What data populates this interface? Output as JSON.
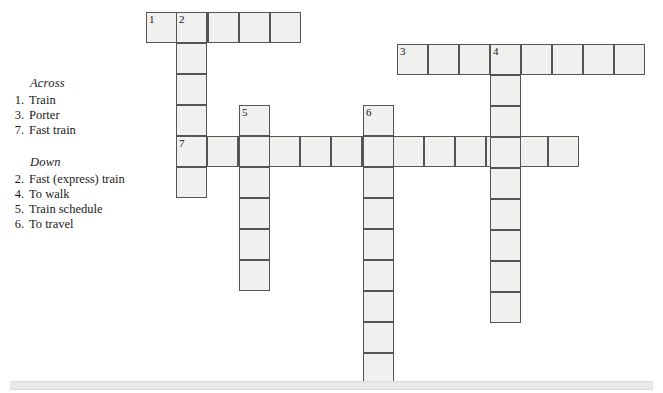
{
  "puzzle": {
    "title": "Crossword Puzzle",
    "cell_size": 31,
    "cell_fill": "#f0f0ee",
    "cell_border": "#555555"
  },
  "clues": {
    "across": {
      "heading": "Across",
      "items": [
        {
          "number": "1.",
          "text": "Train"
        },
        {
          "number": "3.",
          "text": "Porter"
        },
        {
          "number": "7.",
          "text": "Fast train"
        }
      ]
    },
    "down": {
      "heading": "Down",
      "items": [
        {
          "number": "2.",
          "text": "Fast (express) train"
        },
        {
          "number": "4.",
          "text": "To walk"
        },
        {
          "number": "5.",
          "text": "Train schedule"
        },
        {
          "number": "6.",
          "text": "To travel"
        }
      ]
    }
  },
  "grid": {
    "entries": [
      {
        "name": "across-1",
        "direction": "across",
        "number": "1",
        "x": 146,
        "y": 12,
        "length": 5
      },
      {
        "name": "across-3",
        "direction": "across",
        "number": "3",
        "x": 397,
        "y": 44,
        "length": 8
      },
      {
        "name": "across-7",
        "direction": "across",
        "number": "7",
        "x": 176,
        "y": 136,
        "length": 13
      },
      {
        "name": "down-2",
        "direction": "down",
        "number": "2",
        "x": 176,
        "y": 12,
        "length": 6
      },
      {
        "name": "down-4",
        "direction": "down",
        "number": "4",
        "x": 490,
        "y": 44,
        "length": 9
      },
      {
        "name": "down-5",
        "direction": "down",
        "number": "5",
        "x": 239,
        "y": 105,
        "length": 6
      },
      {
        "name": "down-6",
        "direction": "down",
        "number": "6",
        "x": 363,
        "y": 105,
        "length": 9
      }
    ],
    "numbered_cells": [
      {
        "number": "1",
        "x": 146,
        "y": 12
      },
      {
        "number": "2",
        "x": 176,
        "y": 12
      },
      {
        "number": "3",
        "x": 397,
        "y": 44
      },
      {
        "number": "4",
        "x": 490,
        "y": 44
      },
      {
        "number": "5",
        "x": 239,
        "y": 105
      },
      {
        "number": "6",
        "x": 363,
        "y": 105
      },
      {
        "number": "7",
        "x": 176,
        "y": 136
      }
    ]
  }
}
